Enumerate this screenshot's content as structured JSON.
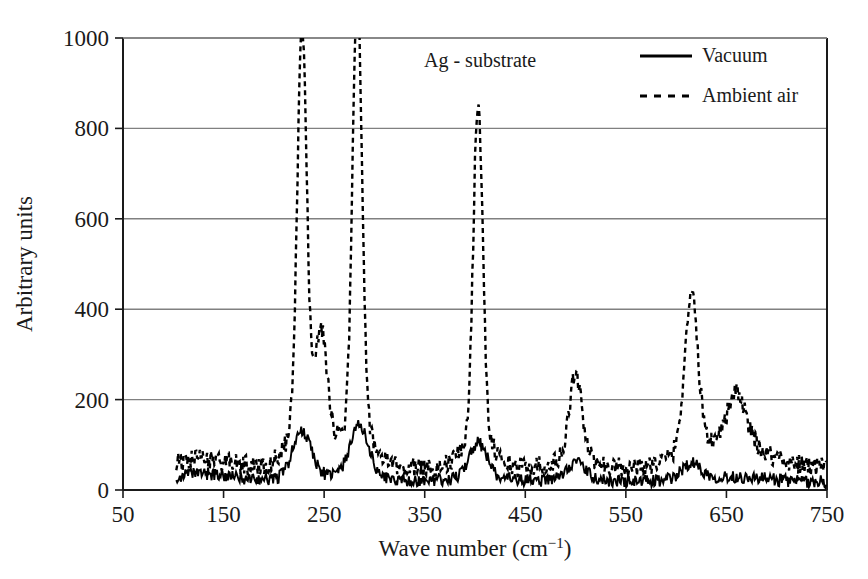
{
  "chart_data": {
    "type": "line",
    "title": "",
    "annotation": "Ag - substrate",
    "xlabel": "Wave number (cm−1)",
    "xlabel_base": "Wave number (cm",
    "xlabel_sup": "−1",
    "xlabel_tail": ")",
    "ylabel": "Arbitrary units",
    "xlim": [
      50,
      750
    ],
    "ylim": [
      0,
      1000
    ],
    "xticks": [
      50,
      150,
      250,
      350,
      450,
      550,
      650,
      750
    ],
    "xtick_labels": [
      "50",
      "150",
      "250",
      "350",
      "450",
      "550",
      "650",
      "750"
    ],
    "yticks": [
      0,
      200,
      400,
      600,
      800,
      1000
    ],
    "ytick_labels": [
      "0",
      "200",
      "400",
      "600",
      "800",
      "1000"
    ],
    "grid": "horizontal",
    "grid_color": "#808080",
    "axis_color": "#1a1a1a",
    "legend_position": "top-right",
    "legend": [
      {
        "name": "Vacuum",
        "style": "solid",
        "color": "#000000"
      },
      {
        "name": "Ambient air",
        "style": "dashed",
        "color": "#000000"
      }
    ],
    "series": [
      {
        "name": "Vacuum",
        "style": "solid",
        "color": "#000000",
        "peaks": [
          {
            "x": 228,
            "y": 100
          },
          {
            "x": 285,
            "y": 112
          },
          {
            "x": 403,
            "y": 78
          },
          {
            "x": 500,
            "y": 40
          },
          {
            "x": 615,
            "y": 35
          }
        ],
        "baseline": 18,
        "noise": 14,
        "x_start": 103,
        "x_end": 750
      },
      {
        "name": "Ambient air",
        "style": "dashed",
        "color": "#000000",
        "peaks": [
          {
            "x": 228,
            "y": 880
          },
          {
            "x": 247,
            "y": 240
          },
          {
            "x": 283,
            "y": 965
          },
          {
            "x": 403,
            "y": 740
          },
          {
            "x": 500,
            "y": 185
          },
          {
            "x": 615,
            "y": 335
          },
          {
            "x": 660,
            "y": 110
          }
        ],
        "baseline": 50,
        "noise": 22,
        "x_start": 103,
        "x_end": 750
      }
    ]
  },
  "figure": {
    "width": 868,
    "height": 579,
    "plot_left": 123,
    "plot_right": 827,
    "plot_top": 38,
    "plot_bottom": 490,
    "background": "#ffffff"
  }
}
